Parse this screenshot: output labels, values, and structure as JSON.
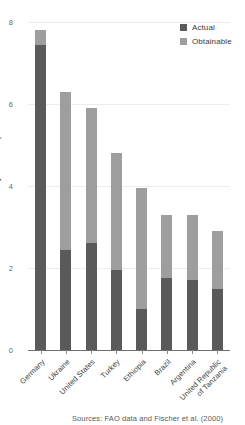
{
  "chart_data": {
    "type": "bar",
    "stacked": true,
    "title": "",
    "xlabel": "",
    "ylabel": "Yield (tonnes/ha)",
    "ylim": [
      0,
      8
    ],
    "yticks": [
      0,
      2,
      4,
      6,
      8
    ],
    "ytick_labels": [
      "0",
      "2",
      "4",
      "6",
      "8"
    ],
    "grid": true,
    "legend_position": "top-right",
    "categories": [
      "Germany",
      "Ukraine",
      "United States",
      "Turkey",
      "Ethiopia",
      "Brazil",
      "Argentina",
      "United Republic\nof Tanzania"
    ],
    "series": [
      {
        "name": "Actual",
        "color": "#5a5a5a",
        "values": [
          7.45,
          2.45,
          2.6,
          1.95,
          1.0,
          1.75,
          1.7,
          1.5
        ]
      },
      {
        "name": "Obtainable",
        "color": "#9e9e9e",
        "values": [
          7.8,
          6.3,
          5.9,
          4.8,
          3.95,
          3.3,
          3.3,
          2.9
        ]
      }
    ],
    "annotations": {
      "source": "Sources: FAO data and Fischer et al. (2000)"
    },
    "colors": {
      "actual": "#5a5a5a",
      "obtainable": "#9e9e9e",
      "gridline": "#ececec",
      "axis": "#6e6e6e",
      "text": "#3c3c3c",
      "background": "#ffffff"
    }
  },
  "legend": {
    "items": [
      {
        "label": "Actual",
        "color": "#5a5a5a"
      },
      {
        "label": "Obtainable",
        "color": "#9e9e9e"
      }
    ]
  },
  "axis": {
    "y_title": "Yield (tonnes/ha)"
  },
  "footer": {
    "source": "Sources: FAO data and Fischer et al. (2000)"
  }
}
